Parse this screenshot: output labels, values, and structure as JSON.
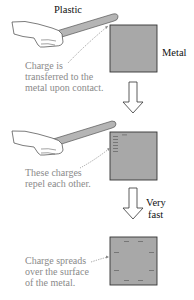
{
  "diagram": {
    "stage1": {
      "rod_label": "Plastic",
      "object_label": "Metal",
      "caption_lines": [
        "Charge is",
        "transferred to the",
        "metal upon contact."
      ]
    },
    "stage2": {
      "caption_lines": [
        "These charges",
        "repel each other."
      ]
    },
    "transition2": {
      "label_lines": [
        "Very",
        "fast"
      ]
    },
    "stage3": {
      "caption_lines": [
        "Charge spreads",
        "over the surface",
        "of the metal."
      ]
    },
    "colors": {
      "metal_fill": "#a8a8a8",
      "metal_border": "#333333",
      "rod_fill": "#b0b0b0",
      "caption_text": "#8a8a8a",
      "label_text": "#111111",
      "charge_mark": "#6a6a6a"
    }
  }
}
